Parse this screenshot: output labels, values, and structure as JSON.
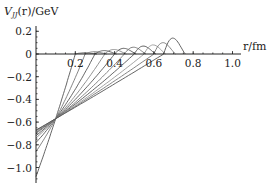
{
  "chart_data": {
    "type": "line",
    "title": "",
    "ylabel_main": "V",
    "ylabel_sub": "JJ",
    "ylabel_rest": "(r)/GeV",
    "xlabel": "r/fm",
    "xlim": [
      0,
      1.0
    ],
    "ylim": [
      -1.13,
      0.2
    ],
    "grid": false,
    "x_ticks": [
      0.2,
      0.4,
      0.6,
      0.8,
      1.0
    ],
    "x_tick_labels": [
      "0.2",
      "0.4",
      "0.6",
      "0.8",
      "1.0"
    ],
    "y_ticks": [
      0.2,
      0,
      -0.2,
      -0.4,
      -0.6,
      -0.8,
      -1.0
    ],
    "y_tick_labels": [
      "0.2",
      "0",
      "−0.2",
      "−0.4",
      "−0.6",
      "−0.8",
      "−1.0"
    ],
    "series": [
      {
        "name": "curve-1",
        "v0": -1.08,
        "r_zero": 0.2,
        "bump_peak": 0.01,
        "color": "#555555"
      },
      {
        "name": "curve-2",
        "v0": -0.86,
        "r_zero": 0.25,
        "bump_peak": 0.02,
        "color": "#777777"
      },
      {
        "name": "curve-3",
        "v0": -0.78,
        "r_zero": 0.3,
        "bump_peak": 0.03,
        "color": "#555555"
      },
      {
        "name": "curve-4",
        "v0": -0.74,
        "r_zero": 0.35,
        "bump_peak": 0.04,
        "color": "#888888"
      },
      {
        "name": "curve-5",
        "v0": -0.72,
        "r_zero": 0.4,
        "bump_peak": 0.05,
        "color": "#555555"
      },
      {
        "name": "curve-6",
        "v0": -0.7,
        "r_zero": 0.45,
        "bump_peak": 0.06,
        "color": "#777777"
      },
      {
        "name": "curve-7",
        "v0": -0.69,
        "r_zero": 0.5,
        "bump_peak": 0.07,
        "color": "#555555"
      },
      {
        "name": "curve-8",
        "v0": -0.68,
        "r_zero": 0.55,
        "bump_peak": 0.08,
        "color": "#999999"
      },
      {
        "name": "curve-9",
        "v0": -0.675,
        "r_zero": 0.6,
        "bump_peak": 0.1,
        "color": "#777777"
      },
      {
        "name": "curve-10",
        "v0": -0.67,
        "r_zero": 0.65,
        "bump_peak": 0.14,
        "color": "#555555"
      }
    ]
  }
}
